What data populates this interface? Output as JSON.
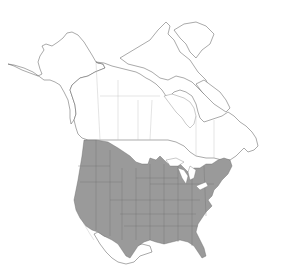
{
  "map": {
    "title": "",
    "region": "North America",
    "projection": "conic outline",
    "background_color": "#ffffff",
    "outline_color": "#555555",
    "range_fill_color": "#9a9a9a",
    "range_description": "Contiguous United States (shaded), excluding extreme southern Florida keys area",
    "labels": []
  }
}
